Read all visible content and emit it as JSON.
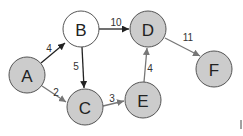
{
  "diagram": {
    "type": "weighted-directed-graph",
    "nodes": [
      {
        "id": "A",
        "label": "A",
        "x": 27,
        "y": 75,
        "fill": "#cccccc"
      },
      {
        "id": "B",
        "label": "B",
        "x": 81,
        "y": 29,
        "fill": "#ffffff"
      },
      {
        "id": "C",
        "label": "C",
        "x": 85,
        "y": 107,
        "fill": "#cccccc"
      },
      {
        "id": "D",
        "label": "D",
        "x": 148,
        "y": 29,
        "fill": "#cccccc"
      },
      {
        "id": "E",
        "label": "E",
        "x": 143,
        "y": 100,
        "fill": "#cccccc"
      },
      {
        "id": "F",
        "label": "F",
        "x": 214,
        "y": 69,
        "fill": "#cccccc"
      }
    ],
    "edges": [
      {
        "from": "A",
        "to": "B",
        "weight": "4",
        "color": "#222222"
      },
      {
        "from": "A",
        "to": "C",
        "weight": "2",
        "color": "#777777"
      },
      {
        "from": "B",
        "to": "C",
        "weight": "5",
        "color": "#222222"
      },
      {
        "from": "B",
        "to": "D",
        "weight": "10",
        "color": "#222222"
      },
      {
        "from": "C",
        "to": "E",
        "weight": "3",
        "color": "#777777"
      },
      {
        "from": "E",
        "to": "D",
        "weight": "4",
        "color": "#777777"
      },
      {
        "from": "D",
        "to": "F",
        "weight": "11",
        "color": "#777777"
      }
    ]
  }
}
